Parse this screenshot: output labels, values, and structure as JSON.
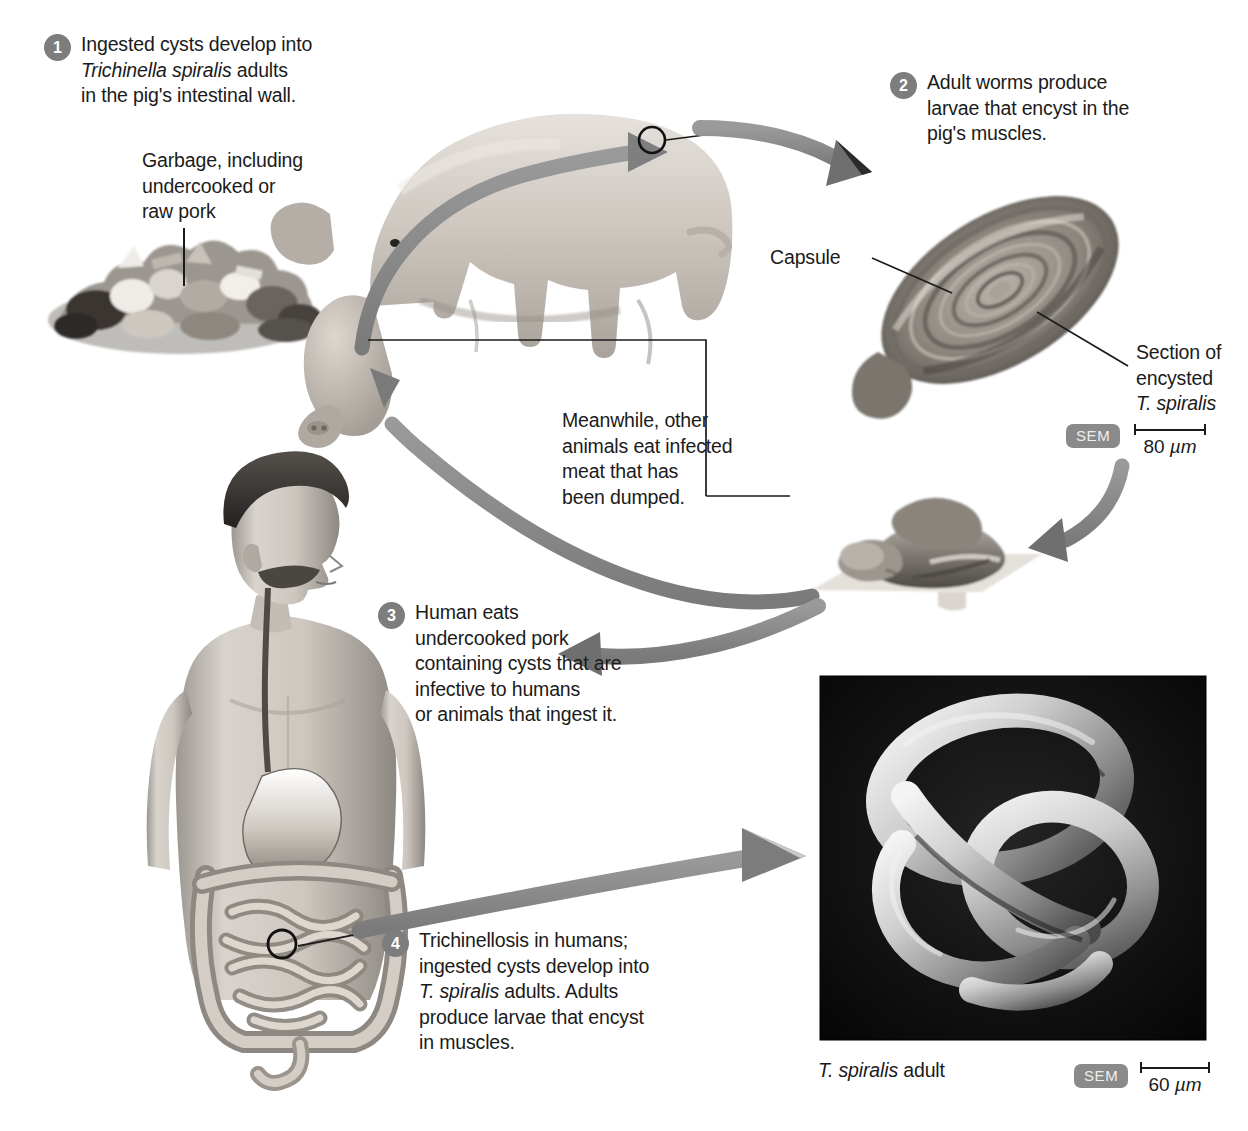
{
  "figure": {
    "accent_gray": "#8a8a8a",
    "badge_gray": "#7d7d7d",
    "text_color": "#1b1b1b"
  },
  "steps": [
    {
      "number": "1",
      "text_line1": "Ingested cysts develop into",
      "text_italic": "Trichinella spiralis",
      "text_after_italic": " adults",
      "text_line3": "in the pig's intestinal wall."
    },
    {
      "number": "2",
      "text": "Adult worms produce\nlarvae that encyst in the\npig's muscles."
    },
    {
      "number": "3",
      "text": "Human eats\nundercooked pork\ncontaining cysts that are\ninfective to humans\nor animals that ingest it."
    },
    {
      "number": "4",
      "line1": "Trichinellosis in humans;",
      "line2": "ingested cysts develop into",
      "italic": "T. spiralis",
      "after_italic": " adults. Adults",
      "line4": "produce larvae that encyst",
      "line5": "in muscles."
    }
  ],
  "labels": {
    "garbage": "Garbage, including\nundercooked or\nraw pork",
    "capsule": "Capsule",
    "section_line1": "Section of",
    "section_line2": "encysted",
    "section_italic": "T. spiralis",
    "meanwhile": "Meanwhile, other\nanimals eat infected\nmeat that has\nbeen dumped.",
    "adult_caption_italic": "T. spiralis",
    "adult_caption_rest": " adult"
  },
  "micrographs": [
    {
      "id": "encysted-cyst",
      "sem_label": "SEM",
      "scale_value": "80",
      "scale_unit": "µm"
    },
    {
      "id": "adult-worm",
      "sem_label": "SEM",
      "scale_value": "60",
      "scale_unit": "µm"
    }
  ]
}
